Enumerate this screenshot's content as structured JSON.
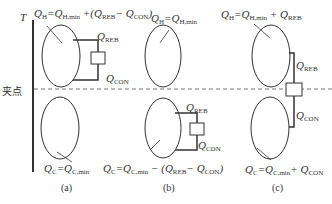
{
  "axis": {
    "label": "T"
  },
  "pinch_label": "夹点",
  "panels": [
    {
      "caption": "(a)",
      "top": {
        "Q": "Q",
        "sub": "H",
        "eq": "=Q",
        "eqsub": "H,min",
        "extra": "+(Q",
        "extrasub1": "REB",
        "extra2": "− Q",
        "extrasub2": "CON",
        "extra3": ")"
      },
      "box_top": {
        "Q": "Q",
        "sub": "REB"
      },
      "box_bottom": {
        "Q": "Q",
        "sub": "CON"
      },
      "bottom": {
        "Q": "Q",
        "sub": "C",
        "eq": "=Q",
        "eqsub": "C,min"
      }
    },
    {
      "caption": "(b)",
      "top": {
        "Q": "Q",
        "sub": "H",
        "eq": "=Q",
        "eqsub": "H,min"
      },
      "box_top": {
        "Q": "Q",
        "sub": "REB"
      },
      "box_bottom": {
        "Q": "Q",
        "sub": "CON"
      },
      "bottom": {
        "Q": "Q",
        "sub": "C",
        "eq": "=Q",
        "eqsub": "C,min",
        "extra": "− (Q",
        "extrasub1": "REB",
        "extra2": "− Q",
        "extrasub2": "CON",
        "extra3": ")"
      }
    },
    {
      "caption": "(c)",
      "top": {
        "Q": "Q",
        "sub": "H",
        "eq": "=Q",
        "eqsub": "H,min",
        "extra": "+ Q",
        "extrasub1": "REB"
      },
      "box_top": {
        "Q": "Q",
        "sub": "REB"
      },
      "box_bottom": {
        "Q": "Q",
        "sub": "CON"
      },
      "bottom": {
        "Q": "Q",
        "sub": "C",
        "eq": "=Q",
        "eqsub": "C,min",
        "extra": "+ Q",
        "extrasub1": "CON"
      }
    }
  ]
}
